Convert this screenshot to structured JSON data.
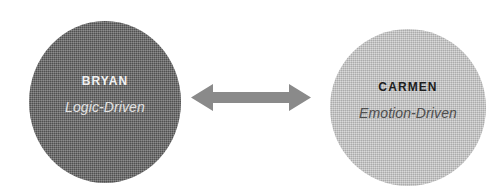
{
  "canvas": {
    "width": 504,
    "height": 194,
    "background_color": "#ffffff"
  },
  "diagram": {
    "type": "two-node-comparison",
    "relationship": "bidirectional",
    "nodes": [
      {
        "id": "left",
        "title": "Bryan",
        "subtitle": "Logic-Driven",
        "shape": "circle",
        "fill_color": "#5e5e5e",
        "title_color": "#f2f2f2",
        "subtitle_color": "#e2e2e2"
      },
      {
        "id": "right",
        "title": "Carmen",
        "subtitle": "Emotion-Driven",
        "shape": "circle",
        "fill_color": "#c9c9c9",
        "title_color": "#1d1d1d",
        "subtitle_color": "#4e4e4e"
      }
    ],
    "connector": {
      "icon": "double-headed-arrow-icon",
      "color": "#8a8a8a",
      "direction": "bidirectional"
    }
  }
}
